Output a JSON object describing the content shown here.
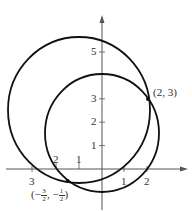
{
  "figure": {
    "colors": {
      "axis": "#555555",
      "curve": "#111111",
      "text": "#333333",
      "background": "#ffffff"
    },
    "x_ticks": [
      {
        "value": -3,
        "label": "3"
      },
      {
        "value": -2,
        "label": "2"
      },
      {
        "value": -1,
        "label": "1"
      },
      {
        "value": 1,
        "label": "1"
      },
      {
        "value": 2,
        "label": "2"
      }
    ],
    "y_ticks": [
      {
        "value": 1,
        "label": "1"
      },
      {
        "value": 2,
        "label": "2"
      },
      {
        "value": 3,
        "label": "3"
      },
      {
        "value": 5,
        "label": "5"
      }
    ],
    "circles": [
      {
        "name": "large-circle",
        "center": [
          -1,
          2.5
        ],
        "radius": 3.1
      },
      {
        "name": "small-circle",
        "center": [
          0,
          1.5
        ],
        "radius": 2.5
      }
    ],
    "points": [
      {
        "name": "point-2-3",
        "x": 2,
        "y": 3,
        "label": "(2, 3)"
      },
      {
        "name": "point-neg",
        "x": -1.5,
        "y": -0.5,
        "label_prefix": "(",
        "num1_sign": "−",
        "num1_top": "3",
        "num1_bottom": "2",
        "sep": ",",
        "num2_sign": "−",
        "num2_top": "1",
        "num2_bottom": "2",
        "label_suffix": ")"
      }
    ]
  }
}
